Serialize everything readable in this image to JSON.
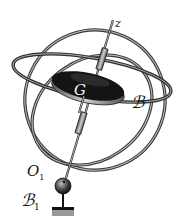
{
  "diagram": {
    "labels": {
      "axis": "z",
      "center_of_mass": "G",
      "rotor_body": "ℬ",
      "pivot": "O",
      "pivot_sub": "1",
      "base_body": "ℬ",
      "base_sub": "1"
    },
    "colors": {
      "ring": "#4a4a4a",
      "rotor_top": "#1a1a1a",
      "rotor_rim": "#9a9a9a",
      "background": "#ffffff"
    }
  }
}
